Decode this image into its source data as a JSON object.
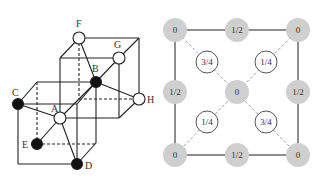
{
  "left_diagram": {
    "title": "crystal structure perspective",
    "atoms": [
      {
        "label": "A",
        "type": "white"
      },
      {
        "label": "B",
        "type": "black"
      },
      {
        "label": "C",
        "type": "black"
      },
      {
        "label": "D",
        "type": "black"
      },
      {
        "label": "E",
        "type": "black"
      },
      {
        "label": "F",
        "type": "white"
      },
      {
        "label": "G",
        "type": "white"
      },
      {
        "label": "H",
        "type": "white"
      }
    ]
  },
  "right_diagram": {
    "title": "projection view",
    "corner_atoms": [
      "0",
      "0",
      "0",
      "0"
    ],
    "edge_atoms": [
      "1/2",
      "1/2",
      "1/2",
      "1/2"
    ],
    "center_atom": "0",
    "inner_atoms": [
      "3/4",
      "1/4",
      "1/4",
      "3/4"
    ],
    "colors": {
      "gray": "#cfcfcf",
      "white": "#ffffff",
      "line": "#444444"
    }
  }
}
